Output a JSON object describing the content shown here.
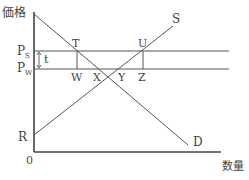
{
  "diagram": {
    "type": "supply-demand",
    "axes": {
      "y_label": "価格",
      "x_label": "数量",
      "origin_label": "0"
    },
    "price_levels": [
      {
        "label_main": "P",
        "label_sub": "S",
        "name": "seller-price"
      },
      {
        "label_main": "P",
        "label_sub": "W",
        "name": "world-price"
      }
    ],
    "tax_label": "t",
    "curves": {
      "supply": {
        "label": "S",
        "intercept_label": "R"
      },
      "demand": {
        "label": "D"
      }
    },
    "points": {
      "T": "T",
      "U": "U",
      "W": "W",
      "X": "X",
      "Y": "Y",
      "Z": "Z"
    },
    "colors": {
      "line": "#555555",
      "text": "#444444"
    }
  }
}
